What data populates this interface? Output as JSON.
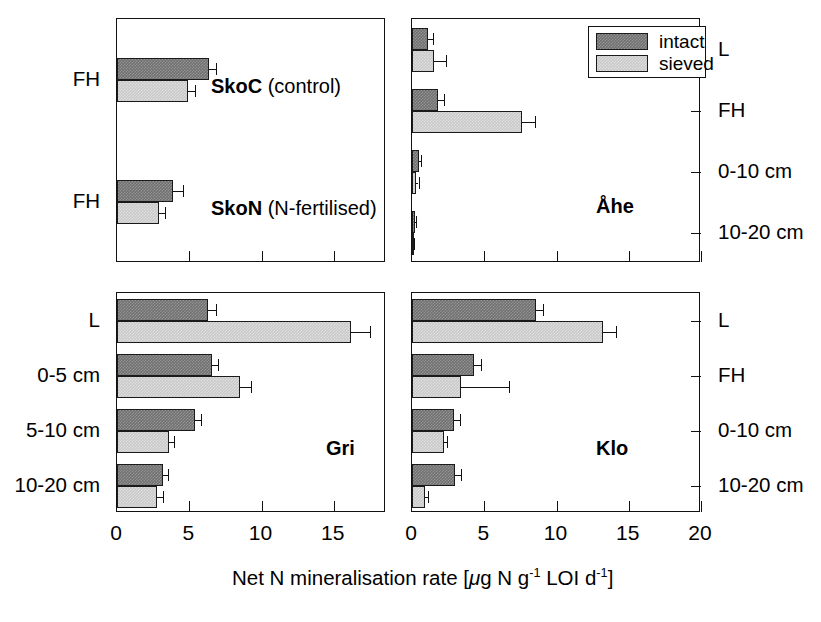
{
  "figure": {
    "axis_title_prefix": "Net N mineralisation rate [",
    "axis_title_mu": "μ",
    "axis_title_mid": "g N g",
    "axis_title_sup1": "-1",
    "axis_title_loi": " LOI d",
    "axis_title_sup2": "-1",
    "axis_title_suffix": "]",
    "colors": {
      "intact": "#707070",
      "sieved": "#c9c9c9",
      "frame": "#111111",
      "background": "#ffffff"
    }
  },
  "legend": {
    "position": "top-right-of-ahe-panel",
    "entries": [
      {
        "label": "intact",
        "swatch": "intact"
      },
      {
        "label": "sieved",
        "swatch": "sieved"
      }
    ]
  },
  "chart_data": {
    "type": "bar",
    "orientation": "horizontal",
    "xlabel": "Net N mineralisation rate [μg N g-1 LOI d-1]",
    "ylabel": "",
    "grid": false,
    "legend_position": "top-right",
    "series_names": [
      "intact",
      "sieved"
    ],
    "panels": [
      {
        "id": "sko",
        "label": "",
        "sublabels": [
          {
            "text_bold": "SkoC",
            "text_regular": " (control)"
          },
          {
            "text_bold": "SkoN",
            "text_regular": " (N-fertilised)"
          }
        ],
        "label_side": "left",
        "xlim": [
          0,
          18.2
        ],
        "xticks": [
          0,
          5,
          10,
          15
        ],
        "xticklabels": [
          "0",
          "5",
          "10",
          "15"
        ],
        "categories": [
          "FH",
          "FH"
        ],
        "series": [
          {
            "name": "intact",
            "values": [
              6.4,
              3.9
            ],
            "errors": [
              0.45,
              0.7
            ]
          },
          {
            "name": "sieved",
            "values": [
              4.9,
              2.9
            ],
            "errors": [
              0.5,
              0.45
            ]
          }
        ]
      },
      {
        "id": "ahe",
        "label": "Åhe",
        "label_side": "right",
        "xlim": [
          0,
          20
        ],
        "xticks": [
          0,
          5,
          10,
          15,
          20
        ],
        "xticklabels": [
          "0",
          "5",
          "10",
          "15",
          "20"
        ],
        "categories": [
          "L",
          "FH",
          "0-10 cm",
          "10-20 cm"
        ],
        "series": [
          {
            "name": "intact",
            "values": [
              1.1,
              1.8,
              0.45,
              0.2
            ],
            "errors": [
              0.35,
              0.4,
              0.2,
              0.1
            ]
          },
          {
            "name": "sieved",
            "values": [
              1.5,
              7.6,
              0.3,
              0.1
            ],
            "errors": [
              0.85,
              0.9,
              0.15,
              0.05
            ]
          }
        ]
      },
      {
        "id": "gri",
        "label": "Gri",
        "label_side": "left",
        "xlim": [
          0,
          18.2
        ],
        "xticks": [
          0,
          5,
          10,
          15
        ],
        "xticklabels": [
          "0",
          "5",
          "10",
          "15"
        ],
        "categories": [
          "L",
          "0-5 cm",
          "5-10 cm",
          "10-20 cm"
        ],
        "series": [
          {
            "name": "intact",
            "values": [
              6.3,
              6.6,
              5.4,
              3.2
            ],
            "errors": [
              0.55,
              0.4,
              0.4,
              0.35
            ]
          },
          {
            "name": "sieved",
            "values": [
              16.2,
              8.5,
              3.6,
              2.8
            ],
            "errors": [
              1.3,
              0.75,
              0.35,
              0.35
            ]
          }
        ]
      },
      {
        "id": "klo",
        "label": "Klo",
        "label_side": "right",
        "xlim": [
          0,
          20
        ],
        "xticks": [
          0,
          5,
          10,
          15,
          20
        ],
        "xticklabels": [
          "0",
          "5",
          "10",
          "15",
          "20"
        ],
        "categories": [
          "L",
          "FH",
          "0-10 cm",
          "10-20 cm"
        ],
        "series": [
          {
            "name": "intact",
            "values": [
              8.6,
              4.3,
              2.9,
              3.0
            ],
            "errors": [
              0.5,
              0.45,
              0.4,
              0.4
            ]
          },
          {
            "name": "sieved",
            "values": [
              13.2,
              3.4,
              2.2,
              0.9
            ],
            "errors": [
              0.9,
              3.3,
              0.25,
              0.2
            ]
          }
        ]
      }
    ]
  }
}
